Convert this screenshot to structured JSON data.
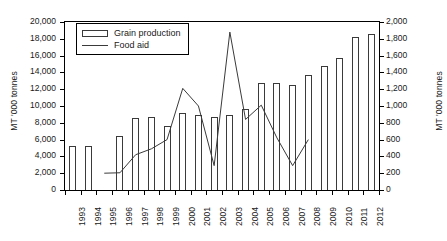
{
  "chart_data": {
    "type": "bar",
    "title": "",
    "subtitle": "",
    "xlabel": "",
    "ylabel": "MT '000 tonnes",
    "ylabel_right": "MT '000 tonnes",
    "ylim": [
      0,
      20000
    ],
    "ylim_right": [
      0,
      2000
    ],
    "ytick_step": 2000,
    "ytick_step_right": 200,
    "grid": false,
    "legend_position": "top-left",
    "categories": [
      "1993",
      "1994",
      "1995",
      "1996",
      "1997",
      "1998",
      "1999",
      "2000",
      "2001",
      "2002",
      "2003",
      "2004",
      "2005",
      "2006",
      "2007",
      "2008",
      "2009",
      "2010",
      "2011",
      "2012"
    ],
    "yticks_left": [
      "0",
      "2,000",
      "4,000",
      "6,000",
      "8,000",
      "10,000",
      "12,000",
      "14,000",
      "16,000",
      "18,000",
      "20,000"
    ],
    "yticks_right": [
      "0",
      "200",
      "400",
      "600",
      "800",
      "1,000",
      "1,200",
      "1,400",
      "1,600",
      "1,800",
      "2,000"
    ],
    "series": [
      {
        "name": "Grain production",
        "type": "bar",
        "axis": "left",
        "unit": "MT '000 tonnes",
        "values": [
          5200,
          5200,
          null,
          6400,
          8600,
          8700,
          7600,
          9200,
          8900,
          8700,
          8900,
          9700,
          12700,
          12700,
          12500,
          13700,
          14800,
          15700,
          18200,
          18600
        ]
      },
      {
        "name": "Food aid",
        "type": "line",
        "axis": "right",
        "unit": "MT '000 tonnes",
        "values": [
          null,
          null,
          200,
          205,
          420,
          490,
          600,
          1210,
          1000,
          290,
          1880,
          840,
          1010,
          620,
          290,
          600,
          null,
          null,
          null,
          null
        ]
      }
    ]
  },
  "legend": {
    "items": [
      {
        "label": "Grain production",
        "marker": "bar-swatch"
      },
      {
        "label": "Food aid",
        "marker": "line-swatch"
      }
    ]
  }
}
